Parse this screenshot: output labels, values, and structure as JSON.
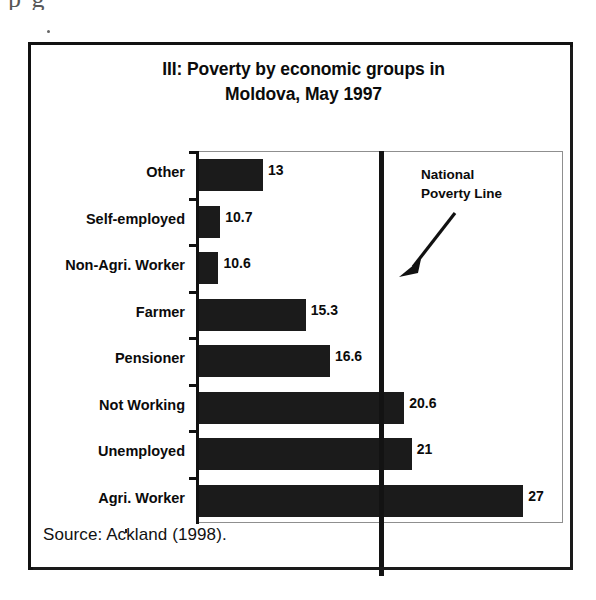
{
  "page_bleed_text": "p            g",
  "figure": {
    "title_line1": "III: Poverty by economic groups in",
    "title_line2": "Moldova, May 1997",
    "source": "Source:  Ackland (1998).",
    "annotation_line1": "National",
    "annotation_line2": "Poverty Line"
  },
  "chart_data": {
    "type": "bar",
    "orientation": "horizontal",
    "title": "III: Poverty by economic groups in Moldova, May 1997",
    "xlabel": "",
    "ylabel": "",
    "categories": [
      "Other",
      "Self-employed",
      "Non-Agri. Worker",
      "Farmer",
      "Pensioner",
      "Not Working",
      "Unemployed",
      "Agri. Worker"
    ],
    "values": [
      13,
      10.7,
      10.6,
      15.3,
      16.6,
      20.6,
      21,
      27
    ],
    "value_labels": [
      "13",
      "10.7",
      "10.6",
      "15.3",
      "16.6",
      "20.6",
      "21",
      "27"
    ],
    "xlim": [
      9.5,
      29.2
    ],
    "grid": false,
    "legend": false,
    "annotations": [
      {
        "text": "National Poverty Line",
        "type": "vertical-reference-line",
        "value": 19.4
      }
    ],
    "series": [
      {
        "name": "Poverty headcount",
        "values": [
          13,
          10.7,
          10.6,
          15.3,
          16.6,
          20.6,
          21,
          27
        ]
      }
    ],
    "source": "Ackland (1998)."
  },
  "colors": {
    "bar": "#1b1b1b",
    "axis": "#111111",
    "frame": "#111111",
    "poverty_line": "#131313",
    "background": "#ffffff"
  }
}
